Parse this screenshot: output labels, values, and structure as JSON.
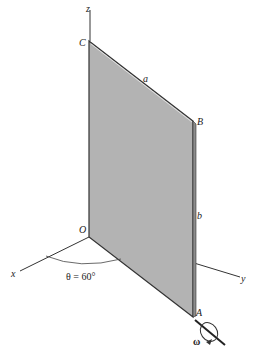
{
  "diagram": {
    "type": "rotating-plate",
    "plate_color": "#b3b3b3",
    "points": {
      "C": "C",
      "B": "B",
      "A": "A",
      "O": "O"
    },
    "axes": {
      "x": "x",
      "y": "y",
      "z": "z"
    },
    "dimensions": {
      "a": "a",
      "b": "b"
    },
    "angle_label": "θ = 60°",
    "angular_velocity": "ω"
  }
}
